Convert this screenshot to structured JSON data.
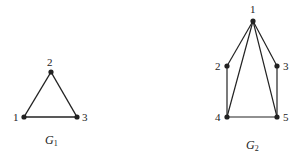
{
  "graphs": [
    {
      "name": "G",
      "subscript": "1",
      "nodes": [
        {
          "id": "1",
          "label": "1",
          "x": 24,
          "y": 117
        },
        {
          "id": "2",
          "label": "2",
          "x": 51,
          "y": 72
        },
        {
          "id": "3",
          "label": "3",
          "x": 77,
          "y": 117
        }
      ],
      "edges": [
        [
          "1",
          "2"
        ],
        [
          "2",
          "3"
        ],
        [
          "1",
          "3"
        ]
      ]
    },
    {
      "name": "G",
      "subscript": "2",
      "nodes": [
        {
          "id": "1",
          "label": "1",
          "x": 253,
          "y": 21
        },
        {
          "id": "2",
          "label": "2",
          "x": 227,
          "y": 66
        },
        {
          "id": "3",
          "label": "3",
          "x": 277,
          "y": 66
        },
        {
          "id": "4",
          "label": "4",
          "x": 227,
          "y": 117
        },
        {
          "id": "5",
          "label": "5",
          "x": 277,
          "y": 117
        }
      ],
      "edges": [
        [
          "1",
          "2"
        ],
        [
          "1",
          "3"
        ],
        [
          "1",
          "4"
        ],
        [
          "1",
          "5"
        ],
        [
          "2",
          "4"
        ],
        [
          "3",
          "5"
        ],
        [
          "4",
          "5"
        ]
      ]
    }
  ],
  "colors": {
    "stroke": "#222222",
    "background": "#ffffff"
  }
}
